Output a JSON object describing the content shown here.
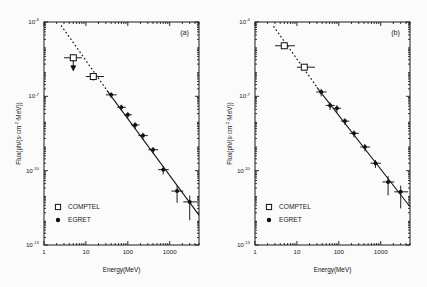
{
  "figure": {
    "background_color": "#fbfbfb",
    "foreground_color": "#111111",
    "xlabel": "Energy(MeV)",
    "ylabel_main": "Flux(ph/(s·cm",
    "ylabel_sup1": "-2",
    "ylabel_mid": "·MeV))",
    "ylabel_full": "Flux(ph/(s*cm^-2*MeV))",
    "x_tick_labels": [
      "1",
      "10",
      "100",
      "1000"
    ],
    "x_tick_values": [
      1,
      10,
      100,
      1000
    ],
    "y_tick_mantissa": "10",
    "y_tick_exponents": [
      "-4",
      "-7",
      "-10",
      "-13"
    ],
    "y_tick_values": [
      0.0001,
      1e-07,
      1e-10,
      1e-13
    ],
    "legend": [
      {
        "symbol": "open-square",
        "label": "COMPTEL"
      },
      {
        "symbol": "filled-circle",
        "label": "EGRET"
      }
    ]
  },
  "chart_data": [
    {
      "type": "scatter",
      "panel": "(a)",
      "title": "",
      "xlabel": "Energy(MeV)",
      "ylabel": "Flux(ph/(s*cm^-2*MeV))",
      "xscale": "log",
      "yscale": "log",
      "xlim": [
        1,
        5000
      ],
      "ylim": [
        1e-13,
        0.0001
      ],
      "grid": false,
      "legend_position": "lower-left",
      "series": [
        {
          "name": "COMPTEL",
          "marker": "open-square",
          "points": [
            {
              "x": 5.0,
              "y": 3.6e-06,
              "xerr_lo": 2.0,
              "xerr_hi": 3.0,
              "yerr": 1.1e-06,
              "upper_limit": true
            },
            {
              "x": 15.0,
              "y": 6.3e-07,
              "xerr_lo": 5.0,
              "xerr_hi": 12.0,
              "yerr": 2e-07,
              "upper_limit": false
            }
          ]
        },
        {
          "name": "EGRET",
          "marker": "filled-circle",
          "points": [
            {
              "x": 40,
              "y": 1.15e-07,
              "xerr_lo": 10,
              "xerr_hi": 14,
              "yerr": 3e-08
            },
            {
              "x": 70,
              "y": 3.6e-08,
              "xerr_lo": 14,
              "xerr_hi": 20,
              "yerr": 1e-08
            },
            {
              "x": 100,
              "y": 1.8e-08,
              "xerr_lo": 18,
              "xerr_hi": 25,
              "yerr": 5e-09
            },
            {
              "x": 150,
              "y": 7e-09,
              "xerr_lo": 30,
              "xerr_hi": 40,
              "yerr": 2e-09
            },
            {
              "x": 230,
              "y": 2.6e-09,
              "xerr_lo": 50,
              "xerr_hi": 70,
              "yerr": 8e-10
            },
            {
              "x": 400,
              "y": 7e-10,
              "xerr_lo": 90,
              "xerr_hi": 130,
              "yerr": 2e-10
            },
            {
              "x": 700,
              "y": 1.1e-10,
              "xerr_lo": 170,
              "xerr_hi": 250,
              "yerr": 4e-11
            },
            {
              "x": 1500,
              "y": 1.5e-11,
              "xerr_lo": 400,
              "xerr_hi": 600,
              "yerr": 1e-11
            },
            {
              "x": 3000,
              "y": 5.5e-12,
              "xerr_lo": 900,
              "xerr_hi": 1500,
              "yerr": 4.5e-12
            }
          ]
        }
      ],
      "fit_line": {
        "style": "solid",
        "x_start": 32,
        "y_start": 1.7e-07,
        "x_end": 5000,
        "y_end": 1.6e-12
      },
      "extrapolation_line": {
        "style": "dotted",
        "x_start": 2.6,
        "y_start": 7e-05,
        "x_end": 33,
        "y_end": 1.6e-07
      }
    },
    {
      "type": "scatter",
      "panel": "(b)",
      "title": "",
      "xlabel": "Energy(MeV)",
      "ylabel": "Flux(ph/(s*cm^-2*MeV))",
      "xscale": "log",
      "yscale": "log",
      "xlim": [
        1,
        5000
      ],
      "ylim": [
        1e-13,
        0.0001
      ],
      "grid": false,
      "legend_position": "lower-left",
      "series": [
        {
          "name": "COMPTEL",
          "marker": "open-square",
          "points": [
            {
              "x": 5.0,
              "y": 1.1e-05,
              "xerr_lo": 2.0,
              "xerr_hi": 4.0,
              "yerr": 2.5e-06,
              "upper_limit": false
            },
            {
              "x": 15.0,
              "y": 1.5e-06,
              "xerr_lo": 5.0,
              "xerr_hi": 12.0,
              "yerr": 4e-07,
              "upper_limit": false
            }
          ]
        },
        {
          "name": "EGRET",
          "marker": "filled-circle",
          "points": [
            {
              "x": 38,
              "y": 1.5e-07,
              "xerr_lo": 9,
              "xerr_hi": 13,
              "yerr": 5e-08
            },
            {
              "x": 62,
              "y": 4.3e-08,
              "xerr_lo": 13,
              "xerr_hi": 18,
              "yerr": 1.5e-08
            },
            {
              "x": 90,
              "y": 3.3e-08,
              "xerr_lo": 17,
              "xerr_hi": 24,
              "yerr": 1.1e-08
            },
            {
              "x": 140,
              "y": 1e-08,
              "xerr_lo": 28,
              "xerr_hi": 38,
              "yerr": 3e-09
            },
            {
              "x": 230,
              "y": 3.2e-09,
              "xerr_lo": 50,
              "xerr_hi": 70,
              "yerr": 1e-09
            },
            {
              "x": 420,
              "y": 9e-10,
              "xerr_lo": 95,
              "xerr_hi": 140,
              "yerr": 3e-10
            },
            {
              "x": 750,
              "y": 2e-10,
              "xerr_lo": 180,
              "xerr_hi": 260,
              "yerr": 7e-11
            },
            {
              "x": 1500,
              "y": 3.5e-11,
              "xerr_lo": 400,
              "xerr_hi": 600,
              "yerr": 2.5e-11
            },
            {
              "x": 3000,
              "y": 1.4e-11,
              "xerr_lo": 900,
              "xerr_hi": 1500,
              "yerr": 1.1e-11
            }
          ]
        }
      ],
      "fit_line": {
        "style": "solid",
        "x_start": 30,
        "y_start": 2.3e-07,
        "x_end": 5000,
        "y_end": 3.5e-12
      },
      "extrapolation_line": {
        "style": "dotted",
        "x_start": 2.8,
        "y_start": 6.5e-05,
        "x_end": 31,
        "y_end": 2.2e-07
      }
    }
  ]
}
